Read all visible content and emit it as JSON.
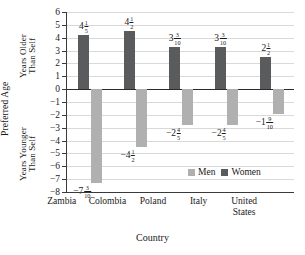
{
  "axis_labels": {
    "outer_left": "Preferred Age",
    "upper_left": "Years Older\nThan Self",
    "lower_left": "Years Younger\nThan Self",
    "x_title": "Country"
  },
  "legend": {
    "men_label": "Men",
    "women_label": "Women",
    "men_color": "#b0b0b0",
    "women_color": "#5a5b5d"
  },
  "y_ticks": [
    "6",
    "5",
    "4",
    "3",
    "2",
    "1",
    "0",
    "−1",
    "−2",
    "−3",
    "−4",
    "−5",
    "−6",
    "−7",
    "−8"
  ],
  "categories": [
    "Zambia",
    "Colombia",
    "Poland",
    "Italy",
    "United\nStates"
  ],
  "women_labels": [
    {
      "whole": "4",
      "num": "1",
      "den": "5"
    },
    {
      "whole": "4",
      "num": "1",
      "den": "2"
    },
    {
      "whole": "3",
      "num": "3",
      "den": "10"
    },
    {
      "whole": "3",
      "num": "3",
      "den": "10"
    },
    {
      "whole": "2",
      "num": "1",
      "den": "2"
    }
  ],
  "men_labels": [
    {
      "whole": "−7",
      "num": "3",
      "den": "10"
    },
    {
      "whole": "−4",
      "num": "1",
      "den": "2"
    },
    {
      "whole": "−2",
      "num": "4",
      "den": "5"
    },
    {
      "whole": "−2",
      "num": "4",
      "den": "5"
    },
    {
      "whole": "−1",
      "num": "9",
      "den": "10"
    }
  ],
  "chart_data": {
    "type": "bar",
    "title": "",
    "xlabel": "Country",
    "ylabel": "Preferred Age (Years Older / Younger Than Self)",
    "ylim": [
      -8,
      6
    ],
    "grid": true,
    "legend_position": "inside-lower-right",
    "categories": [
      "Zambia",
      "Colombia",
      "Poland",
      "Italy",
      "United States"
    ],
    "series": [
      {
        "name": "Women",
        "color": "#5a5b5d",
        "values": [
          4.2,
          4.5,
          3.3,
          3.3,
          2.5
        ],
        "value_labels": [
          "4 1/5",
          "4 1/2",
          "3 3/10",
          "3 3/10",
          "2 1/2"
        ]
      },
      {
        "name": "Men",
        "color": "#b0b0b0",
        "values": [
          -7.3,
          -4.5,
          -2.8,
          -2.8,
          -1.9
        ],
        "value_labels": [
          "-7 3/10",
          "-4 1/2",
          "-2 4/5",
          "-2 4/5",
          "-1 9/10"
        ]
      }
    ],
    "yticks": [
      6,
      5,
      4,
      3,
      2,
      1,
      0,
      -1,
      -2,
      -3,
      -4,
      -5,
      -6,
      -7,
      -8
    ]
  }
}
